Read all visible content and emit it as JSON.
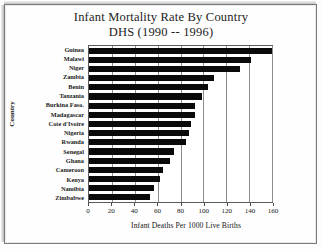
{
  "chart_data": {
    "type": "bar",
    "orientation": "horizontal",
    "title": "Infant Mortality Rate By Country",
    "subtitle": "DHS (1990 -- 1996)",
    "xlabel": "Infant Deaths Per 1000 Live Births",
    "ylabel": "Country",
    "xlim": [
      0,
      160
    ],
    "xticks": [
      0,
      20,
      40,
      60,
      80,
      100,
      120,
      140,
      160
    ],
    "xtick_labels": [
      "0",
      "20",
      "40",
      "60",
      "80",
      "100",
      "120",
      "140",
      "160"
    ],
    "grid": true,
    "legend": null,
    "bar_color": "#0a0a0a",
    "categories": [
      "Guinea",
      "Malawi",
      "Niger",
      "Zambia",
      "Benin",
      "Tanzania",
      "Burkina Faso.",
      "Madagascar",
      "Cote d'Ivoire",
      "Nigeria",
      "Rwanda",
      "Senegal",
      "Ghana",
      "Cameroon",
      "Kenya",
      "Namibia",
      "Zimbabwe"
    ],
    "values": [
      160,
      142,
      132,
      109,
      104,
      99,
      93,
      93,
      89,
      87,
      85,
      74,
      71,
      65,
      62,
      57,
      53
    ]
  },
  "figure": {
    "title": "Infant Mortality Rate By Country",
    "subtitle": "DHS (1990 -- 1996)",
    "xlabel": "Infant Deaths Per 1000 Live Births",
    "ylabel": "Country"
  }
}
